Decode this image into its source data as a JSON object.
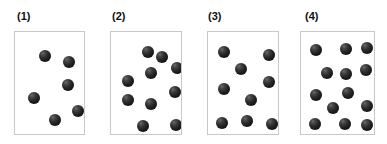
{
  "figure": {
    "title": "",
    "background_color": "#ffffff",
    "panel_border_color": "#c8c8c8",
    "panel_fill_color": "#ffffff",
    "sphere_color": "#2b2b2b",
    "sphere_highlight_color": "#6e6e6e"
  },
  "chart_data": {
    "type": "scatter",
    "title": "",
    "xlabel": "",
    "ylabel": "",
    "grid": false,
    "legend": null,
    "panels": [
      {
        "label": "(1)",
        "count": 6,
        "box": {
          "x": 14,
          "y": 31,
          "width": 71,
          "height": 104
        },
        "label_pos": {
          "x": 17,
          "y": 10
        },
        "sphere_radius": 6,
        "points": [
          {
            "x": 24,
            "y": 18
          },
          {
            "x": 48,
            "y": 24
          },
          {
            "x": 47,
            "y": 47
          },
          {
            "x": 13,
            "y": 60
          },
          {
            "x": 57,
            "y": 73
          },
          {
            "x": 34,
            "y": 82
          }
        ]
      },
      {
        "label": "(2)",
        "count": 10,
        "box": {
          "x": 110,
          "y": 31,
          "width": 72,
          "height": 104
        },
        "label_pos": {
          "x": 112,
          "y": 10
        },
        "sphere_radius": 6,
        "points": [
          {
            "x": 31,
            "y": 14
          },
          {
            "x": 60,
            "y": 30
          },
          {
            "x": 34,
            "y": 35
          },
          {
            "x": 11,
            "y": 43
          },
          {
            "x": 58,
            "y": 54
          },
          {
            "x": 11,
            "y": 62
          },
          {
            "x": 34,
            "y": 66
          },
          {
            "x": 26,
            "y": 88
          },
          {
            "x": 59,
            "y": 87
          },
          {
            "x": 45,
            "y": 19
          }
        ]
      },
      {
        "label": "(3)",
        "count": 9,
        "box": {
          "x": 207,
          "y": 31,
          "width": 72,
          "height": 104
        },
        "label_pos": {
          "x": 208,
          "y": 10
        },
        "sphere_radius": 6,
        "points": [
          {
            "x": 10,
            "y": 14
          },
          {
            "x": 55,
            "y": 17
          },
          {
            "x": 27,
            "y": 31
          },
          {
            "x": 55,
            "y": 44
          },
          {
            "x": 10,
            "y": 51
          },
          {
            "x": 37,
            "y": 62
          },
          {
            "x": 8,
            "y": 85
          },
          {
            "x": 33,
            "y": 83
          },
          {
            "x": 58,
            "y": 86
          }
        ]
      },
      {
        "label": "(4)",
        "count": 13,
        "box": {
          "x": 300,
          "y": 31,
          "width": 75,
          "height": 104
        },
        "label_pos": {
          "x": 305,
          "y": 10
        },
        "sphere_radius": 6,
        "points": [
          {
            "x": 9,
            "y": 12
          },
          {
            "x": 39,
            "y": 11
          },
          {
            "x": 20,
            "y": 35
          },
          {
            "x": 39,
            "y": 36
          },
          {
            "x": 59,
            "y": 32
          },
          {
            "x": 9,
            "y": 57
          },
          {
            "x": 41,
            "y": 55
          },
          {
            "x": 26,
            "y": 70
          },
          {
            "x": 60,
            "y": 68
          },
          {
            "x": 8,
            "y": 86
          },
          {
            "x": 38,
            "y": 86
          },
          {
            "x": 60,
            "y": 87
          },
          {
            "x": 60,
            "y": 10
          }
        ]
      }
    ]
  }
}
